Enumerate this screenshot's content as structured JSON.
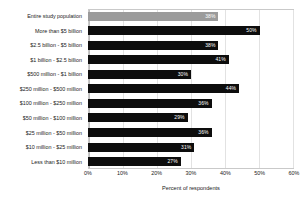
{
  "chart_data": {
    "type": "bar",
    "orientation": "horizontal",
    "title": "",
    "xlabel": "Percent of respondents",
    "ylabel": "",
    "xlim": [
      0,
      60
    ],
    "xticks": [
      "0%",
      "10%",
      "20%",
      "30%",
      "40%",
      "50%",
      "60%"
    ],
    "xtick_values": [
      0,
      10,
      20,
      30,
      40,
      50,
      60
    ],
    "grid": true,
    "legend": "none",
    "categories": [
      "Entire study population",
      "More than $5 billion",
      "$2.5 billion - $5 billion",
      "$1 billion - $2.5 billion",
      "$500 million - $1 billion",
      "$250 million - $500 million",
      "$100 million - $250 million",
      "$50 million - $100 million",
      "$25 million - $50 million",
      "$10 million - $25 million",
      "Less than $10 million"
    ],
    "values": [
      38,
      50,
      38,
      41,
      30,
      44,
      36,
      29,
      36,
      31,
      27
    ],
    "value_labels": [
      "38%",
      "50%",
      "38%",
      "41%",
      "30%",
      "44%",
      "36%",
      "29%",
      "36%",
      "31%",
      "27%"
    ],
    "bar_colors": [
      "#9b9b9b",
      "#0d0d0d",
      "#0d0d0d",
      "#0d0d0d",
      "#0d0d0d",
      "#0d0d0d",
      "#0d0d0d",
      "#0d0d0d",
      "#0d0d0d",
      "#0d0d0d",
      "#0d0d0d"
    ]
  }
}
